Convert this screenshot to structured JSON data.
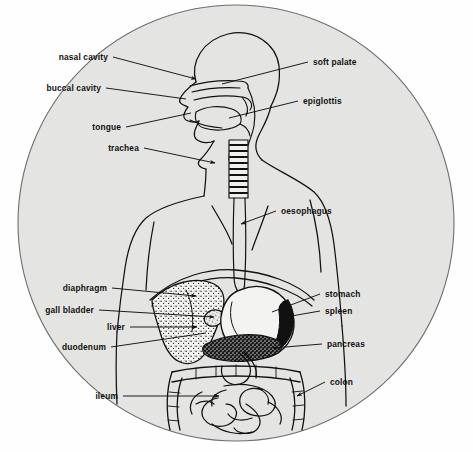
{
  "diagram": {
    "frame_shape": "circle",
    "colors": {
      "page_background": "#fefefe",
      "disc_fill": "#e4e4e2",
      "disc_outline": "#6f6f6f",
      "ink": "#111111",
      "organ_dark": "#111111",
      "organ_light": "#f2f2f0"
    },
    "label_count": 13,
    "labels_left": [
      {
        "id": "nasal-cavity",
        "text": "nasal cavity",
        "x": 108,
        "y": 57,
        "tip_x": 196,
        "tip_y": 79,
        "arrow": true
      },
      {
        "id": "buccal-cavity",
        "text": "buccal cavity",
        "x": 101,
        "y": 88,
        "tip_x": 186,
        "tip_y": 99,
        "arrow": false
      },
      {
        "id": "tongue",
        "text": "tongue",
        "x": 121,
        "y": 127,
        "tip_x": 191,
        "tip_y": 113,
        "arrow": false
      },
      {
        "id": "trachea",
        "text": "trachea",
        "x": 139,
        "y": 148,
        "tip_x": 215,
        "tip_y": 163,
        "arrow": true
      },
      {
        "id": "diaphragm",
        "text": "diaphragm",
        "x": 107,
        "y": 288,
        "tip_x": 196,
        "tip_y": 296,
        "arrow": true
      },
      {
        "id": "gall-bladder",
        "text": "gall bladder",
        "x": 94,
        "y": 310,
        "tip_x": 214,
        "tip_y": 317,
        "arrow": true
      },
      {
        "id": "liver",
        "text": "liver",
        "x": 125,
        "y": 327,
        "tip_x": 197,
        "tip_y": 327,
        "arrow": true
      },
      {
        "id": "duodenum",
        "text": "duodenum",
        "x": 106,
        "y": 347,
        "tip_x": 206,
        "tip_y": 333,
        "arrow": false
      },
      {
        "id": "ileum",
        "text": "ileum",
        "x": 118,
        "y": 396,
        "tip_x": 219,
        "tip_y": 396,
        "arrow": true
      }
    ],
    "labels_right": [
      {
        "id": "soft-palate",
        "text": "soft palate",
        "x": 313,
        "y": 62,
        "tip_x": 222,
        "tip_y": 84,
        "arrow": false
      },
      {
        "id": "epiglottis",
        "text": "epiglottis",
        "x": 303,
        "y": 101,
        "tip_x": 229,
        "tip_y": 118,
        "arrow": false
      },
      {
        "id": "oesophagus",
        "text": "oesophagus",
        "x": 281,
        "y": 211,
        "tip_x": 241,
        "tip_y": 224,
        "arrow": true
      },
      {
        "id": "stomach",
        "text": "stomach",
        "x": 325,
        "y": 294,
        "tip_x": 272,
        "tip_y": 312,
        "arrow": false
      },
      {
        "id": "spleen",
        "text": "spleen",
        "x": 325,
        "y": 311,
        "tip_x": 280,
        "tip_y": 318,
        "arrow": true
      },
      {
        "id": "pancreas",
        "text": "pancreas",
        "x": 327,
        "y": 344,
        "tip_x": 273,
        "tip_y": 348,
        "arrow": true
      },
      {
        "id": "colon",
        "text": "colon",
        "x": 330,
        "y": 382,
        "tip_x": 297,
        "tip_y": 396,
        "arrow": true
      }
    ]
  }
}
